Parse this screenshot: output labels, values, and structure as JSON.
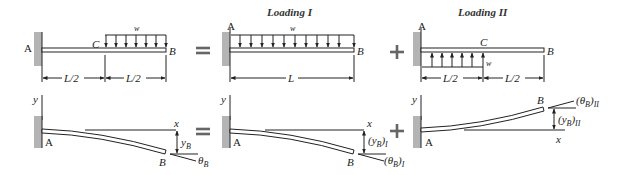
{
  "panels": {
    "original": {
      "point_a": "A",
      "point_b": "B",
      "point_c": "C",
      "load": "w",
      "dim_left": "L/2",
      "dim_right": "L/2"
    },
    "loading_1": {
      "title": "Loading I",
      "point_a": "A",
      "point_b": "B",
      "load": "w",
      "dim": "L"
    },
    "loading_2": {
      "title": "Loading II",
      "point_a": "A",
      "point_b": "B",
      "point_c": "C",
      "load": "w",
      "dim_left": "L/2",
      "dim_right": "L/2"
    }
  },
  "deflected": {
    "original": {
      "y_axis": "y",
      "x_axis": "x",
      "point_a": "A",
      "point_b": "B",
      "deflection": "y",
      "deflection_sub": "B",
      "slope": "θ",
      "slope_sub": "B"
    },
    "loading_1": {
      "y_axis": "y",
      "x_axis": "x",
      "point_a": "A",
      "point_b": "B",
      "deflection": "(y",
      "deflection_sub": "B",
      "deflection_suffix": ")",
      "deflection_case": "I",
      "slope": "(θ",
      "slope_sub": "B",
      "slope_suffix": ")",
      "slope_case": "I"
    },
    "loading_2": {
      "y_axis": "y",
      "x_axis": "x",
      "point_a": "A",
      "point_b": "B",
      "deflection": "(y",
      "deflection_sub": "B",
      "deflection_suffix": ")",
      "deflection_case": "II",
      "slope": "(θ",
      "slope_sub": "B",
      "slope_suffix": ")",
      "slope_case": "II"
    }
  },
  "operators": {
    "equals": "=",
    "plus": "+"
  }
}
